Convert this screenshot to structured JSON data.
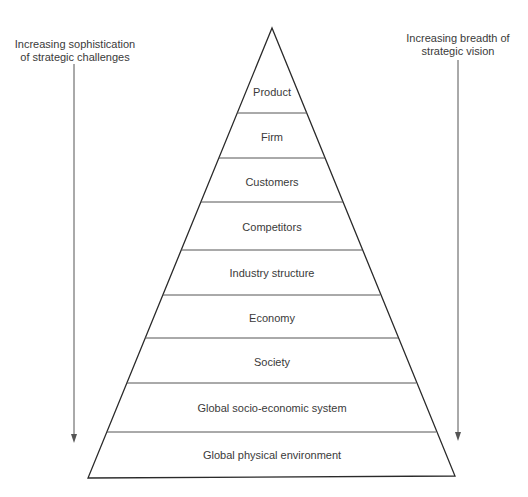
{
  "diagram": {
    "type": "pyramid",
    "left_annotation": {
      "line1": "Increasing sophistication",
      "line2": "of strategic challenges",
      "direction": "down"
    },
    "right_annotation": {
      "line1": "Increasing breadth of",
      "line2": "strategic vision",
      "direction": "down"
    },
    "tiers": [
      {
        "label": "Product"
      },
      {
        "label": "Firm"
      },
      {
        "label": "Customers"
      },
      {
        "label": "Competitors"
      },
      {
        "label": "Industry structure"
      },
      {
        "label": "Economy"
      },
      {
        "label": "Society"
      },
      {
        "label": "Global socio-economic system"
      },
      {
        "label": "Global physical environment"
      }
    ],
    "colors": {
      "outline": "#2a2a2a",
      "divider": "#555555",
      "arrow": "#555555",
      "text": "#3a3a3a"
    }
  }
}
